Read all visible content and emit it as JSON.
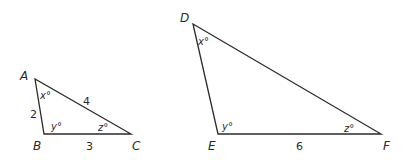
{
  "triangles": [
    {
      "name": "ABC",
      "vertices": [
        "A",
        "B",
        "C"
      ],
      "angles": {
        "A": "x°",
        "B": "y°",
        "C": "z°"
      },
      "sides": {
        "AB": "2",
        "AC": "4",
        "BC": "3"
      }
    },
    {
      "name": "DEF",
      "vertices": [
        "D",
        "E",
        "F"
      ],
      "angles": {
        "D": "x°",
        "E": "y°",
        "F": "z°"
      },
      "sides": {
        "EF": "6"
      }
    }
  ]
}
